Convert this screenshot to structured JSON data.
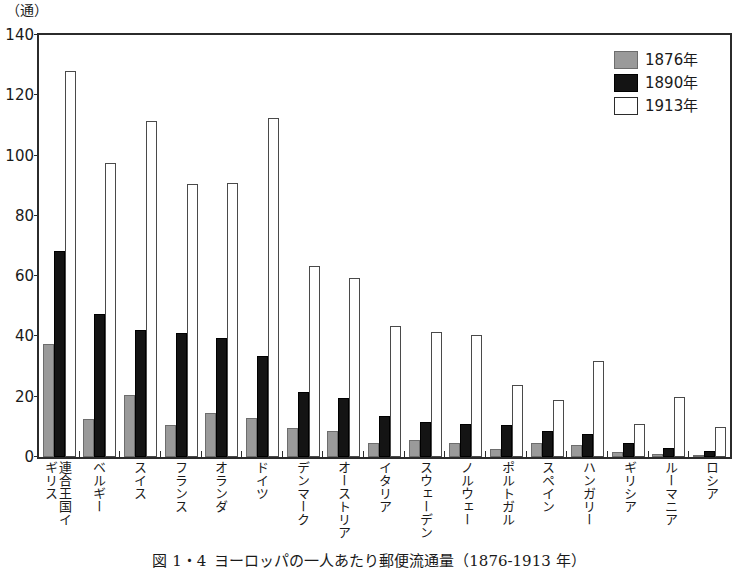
{
  "figure": {
    "unit_label": "（通）",
    "caption_number": "図 1・4",
    "caption_text": "ヨーロッパの一人あたり郵便流通量（1876-1913 年）"
  },
  "legend": {
    "position": "top-right",
    "items": [
      {
        "label": "1876年",
        "color": "#9a9a9a",
        "swatch": "y1876"
      },
      {
        "label": "1890年",
        "color": "#141414",
        "swatch": "y1890"
      },
      {
        "label": "1913年",
        "color": "#ffffff",
        "swatch": "y1913"
      }
    ]
  },
  "chart_data": {
    "type": "bar",
    "title": "ヨーロッパの一人あたり郵便流通量（1876-1913 年）",
    "xlabel": "",
    "ylabel": "（通）",
    "ylim": [
      0,
      140
    ],
    "yticks": [
      0,
      20,
      40,
      60,
      80,
      100,
      120,
      140
    ],
    "grid": false,
    "legend_position": "top-right",
    "categories": [
      "連合王国イギリス",
      "ベルギー",
      "スイス",
      "フランス",
      "オランダ",
      "ドイツ",
      "デンマーク",
      "オーストリア",
      "イタリア",
      "スウェーデン",
      "ノルウェー",
      "ポルトガル",
      "スペイン",
      "ハンガリー",
      "ギリシア",
      "ルーマニア",
      "ロシア"
    ],
    "series": [
      {
        "name": "1876年",
        "color": "#9a9a9a",
        "values": [
          37.5,
          12.5,
          20.5,
          10.5,
          14.5,
          13.0,
          9.5,
          8.5,
          4.5,
          5.5,
          4.5,
          2.5,
          4.5,
          4.0,
          1.5,
          1.0,
          0.7
        ]
      },
      {
        "name": "1890年",
        "color": "#141414",
        "values": [
          68.5,
          47.5,
          42.0,
          41.0,
          39.5,
          33.5,
          21.5,
          19.5,
          13.5,
          11.5,
          11.0,
          10.5,
          8.5,
          7.5,
          4.5,
          3.0,
          2.0
        ]
      },
      {
        "name": "1913年",
        "color": "#ffffff",
        "values": [
          128.0,
          97.5,
          111.5,
          90.5,
          91.0,
          112.5,
          63.5,
          59.5,
          43.5,
          41.5,
          40.5,
          24.0,
          19.0,
          32.0,
          11.0,
          20.0,
          10.0
        ]
      }
    ]
  }
}
